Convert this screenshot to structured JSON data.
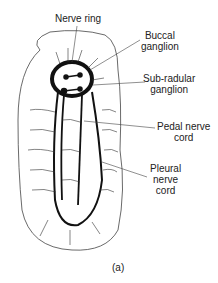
{
  "labels": {
    "nerve_ring": "Nerve ring",
    "buccal_1": "Buccal",
    "buccal_2": "ganglion",
    "subradular_1": "Sub-radular",
    "subradular_2": "ganglion",
    "pedal_1": "Pedal nerve",
    "pedal_2": "cord",
    "pleural_1": "Pleural",
    "pleural_2": "nerve",
    "pleural_3": "cord"
  },
  "caption": "(a)",
  "colors": {
    "ink": "#111111",
    "line": "#444444",
    "bg": "#ffffff"
  }
}
